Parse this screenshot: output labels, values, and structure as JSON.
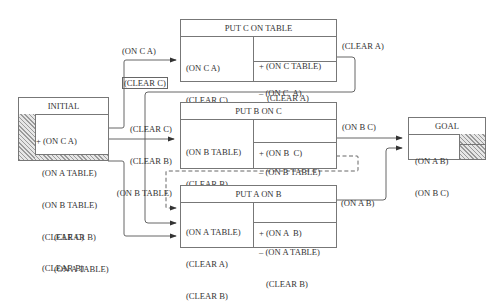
{
  "operators": {
    "initial": {
      "title": "INITIAL",
      "effects": [
        "+ (ON C A)",
        "(ON A TABLE)",
        "(ON B TABLE)",
        "(CLEAR C)",
        "(CLEAR B)"
      ]
    },
    "put_c_on_table": {
      "title": "PUT C ON TABLE",
      "preconditions": [
        "(ON C A)",
        "(CLEAR C)"
      ],
      "add_list": [
        "+ (ON C TABLE)",
        "(CLEAR A)"
      ],
      "delete_list": [
        "– (ON C  A)"
      ]
    },
    "put_b_on_c": {
      "title": "PUT B ON C",
      "preconditions": [
        "(ON B TABLE)",
        "(CLEAR B)",
        "(CLEAR C)"
      ],
      "add_list": [
        "+ (ON B  C)"
      ],
      "delete_list": [
        "– (ON B TABLE)",
        "(CLEAR C)"
      ]
    },
    "put_a_on_b": {
      "title": "PUT A ON B",
      "preconditions": [
        "(ON A TABLE)",
        "(CLEAR A)",
        "(CLEAR B)"
      ],
      "add_list": [
        "+ (ON A  B)"
      ],
      "delete_list": [
        "– (ON A TABLE)",
        "(CLEAR B)"
      ]
    },
    "goal": {
      "title": "GOAL",
      "preconditions": [
        "(ON A B)",
        "(ON B C)"
      ]
    }
  },
  "links": {
    "to_put_c_on_table": [
      "(ON C A)",
      "(CLEAR C)"
    ],
    "to_put_b_on_c": [
      "(CLEAR C)",
      "(CLEAR B)",
      "(ON B TABLE)"
    ],
    "to_put_a_on_b": [
      "(CLEAR B)",
      "(ON A TABLE)"
    ],
    "put_c_clear_a": "(CLEAR A)",
    "put_b_on_b_c": "(ON B C)",
    "put_a_on_a_b": "(ON A B)"
  }
}
